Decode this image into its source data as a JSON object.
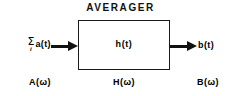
{
  "diagram": {
    "title": "AVERAGER",
    "background_color": "#ffffff",
    "line_color": "#111111",
    "block": {
      "label": "h(t)",
      "spectrum_label_prefix": "H",
      "spectrum_label": "H(ω)"
    },
    "input": {
      "sum_symbol": "Σ",
      "sum_index": "i",
      "signal": "a(t)",
      "signal_full": "Σᵢ a(t)",
      "spectrum_prefix": "A",
      "spectrum_label": "A(ω)",
      "arrow": "right-arrow"
    },
    "output": {
      "signal": "b(t)",
      "spectrum_prefix": "B",
      "spectrum_label": "B(ω)",
      "arrow": "right-arrow"
    },
    "paren_open": "(",
    "paren_close": ")",
    "omega_symbol": "ω"
  },
  "chart_data": {
    "type": "diagram",
    "subtype": "block-diagram",
    "title": "AVERAGER",
    "nodes": [
      {
        "id": "input",
        "label": "Σᵢ a(t)",
        "domain": "time",
        "role": "input-signal"
      },
      {
        "id": "block",
        "label": "h(t)",
        "domain": "time",
        "role": "system-impulse-response"
      },
      {
        "id": "output",
        "label": "b(t)",
        "domain": "time",
        "role": "output-signal"
      },
      {
        "id": "input-spectrum",
        "label": "A(ω)",
        "domain": "frequency",
        "role": "input-spectrum"
      },
      {
        "id": "system-spectrum",
        "label": "H(ω)",
        "domain": "frequency",
        "role": "transfer-function"
      },
      {
        "id": "output-spectrum",
        "label": "B(ω)",
        "domain": "frequency",
        "role": "output-spectrum"
      }
    ],
    "edges": [
      {
        "from": "input",
        "to": "block",
        "style": "solid-arrow"
      },
      {
        "from": "block",
        "to": "output",
        "style": "solid-arrow"
      }
    ]
  }
}
